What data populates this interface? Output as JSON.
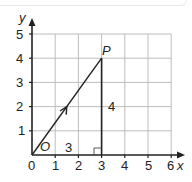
{
  "diagram": {
    "type": "coordinate-grid-vector",
    "axes": {
      "x_label": "x",
      "y_label": "y",
      "x_ticks": [
        "0",
        "1",
        "2",
        "3",
        "4",
        "5",
        "6"
      ],
      "y_ticks": [
        "1",
        "2",
        "3",
        "4",
        "5"
      ],
      "x_range": [
        0,
        6
      ],
      "y_range": [
        0,
        5
      ]
    },
    "points": {
      "origin_label": "O",
      "p_label": "P",
      "p_coords": [
        3,
        4
      ]
    },
    "segments": {
      "horizontal_length": "3",
      "vertical_length": "4"
    },
    "colors": {
      "grid": "#b8b8b8",
      "axis": "#222222",
      "line": "#222222"
    }
  }
}
